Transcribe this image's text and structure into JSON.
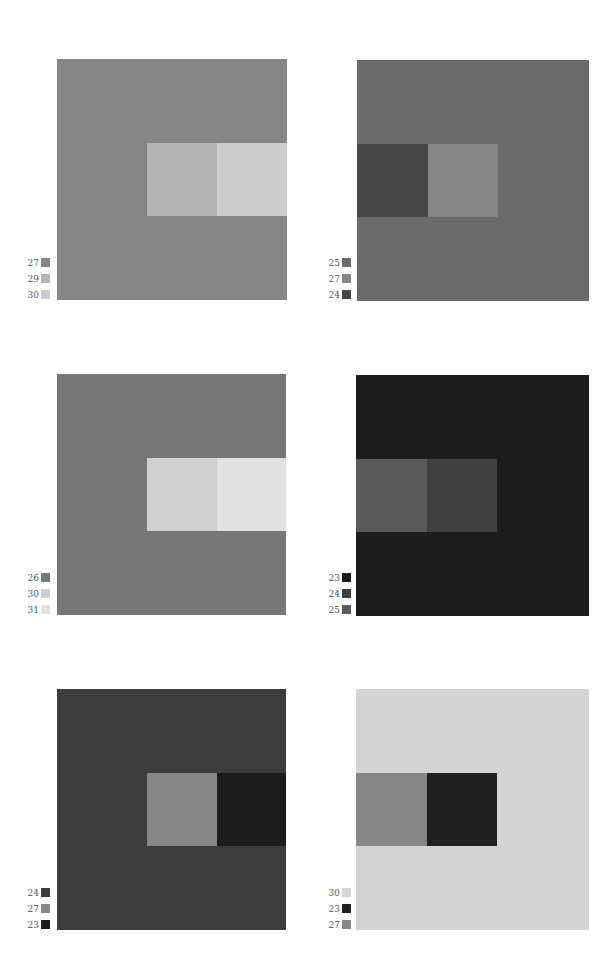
{
  "figure": {
    "panels": [
      {
        "id": 1,
        "background": {
          "value": "27",
          "color": "#858585"
        },
        "inner_left": {
          "value": "29",
          "color": "#b4b4b4"
        },
        "inner_right": {
          "value": "30",
          "color": "#cccccc"
        },
        "inner_position": "right",
        "legend": [
          {
            "label": "27",
            "color": "#858585"
          },
          {
            "label": "29",
            "color": "#b4b4b4"
          },
          {
            "label": "30",
            "color": "#cccccc"
          }
        ]
      },
      {
        "id": 2,
        "background": {
          "value": "25",
          "color": "#6a6a6a"
        },
        "inner_left": {
          "value": "24",
          "color": "#454545"
        },
        "inner_right": {
          "value": "27",
          "color": "#858585"
        },
        "inner_position": "left",
        "legend": [
          {
            "label": "25",
            "color": "#6a6a6a"
          },
          {
            "label": "27",
            "color": "#858585"
          },
          {
            "label": "24",
            "color": "#454545"
          }
        ]
      },
      {
        "id": 3,
        "background": {
          "value": "26",
          "color": "#777777"
        },
        "inner_left": {
          "value": "30",
          "color": "#d0d0d0"
        },
        "inner_right": {
          "value": "31",
          "color": "#e2e2e2"
        },
        "inner_position": "right",
        "legend": [
          {
            "label": "26",
            "color": "#777777"
          },
          {
            "label": "30",
            "color": "#d0d0d0"
          },
          {
            "label": "31",
            "color": "#e2e2e2"
          }
        ]
      },
      {
        "id": 4,
        "background": {
          "value": "23",
          "color": "#1c1c1c"
        },
        "inner_left": {
          "value": "25",
          "color": "#5a5a5a"
        },
        "inner_right": {
          "value": "24",
          "color": "#404040"
        },
        "inner_position": "left",
        "legend": [
          {
            "label": "23",
            "color": "#1c1c1c"
          },
          {
            "label": "24",
            "color": "#404040"
          },
          {
            "label": "25",
            "color": "#5a5a5a"
          }
        ]
      },
      {
        "id": 5,
        "background": {
          "value": "24",
          "color": "#3c3c3c"
        },
        "inner_left": {
          "value": "27",
          "color": "#878787"
        },
        "inner_right": {
          "value": "23",
          "color": "#1c1c1c"
        },
        "inner_position": "right",
        "legend": [
          {
            "label": "24",
            "color": "#3c3c3c"
          },
          {
            "label": "27",
            "color": "#878787"
          },
          {
            "label": "23",
            "color": "#1c1c1c"
          }
        ]
      },
      {
        "id": 6,
        "background": {
          "value": "30",
          "color": "#d4d4d4"
        },
        "inner_left": {
          "value": "27",
          "color": "#868686"
        },
        "inner_right": {
          "value": "23",
          "color": "#202020"
        },
        "inner_position": "left",
        "legend": [
          {
            "label": "30",
            "color": "#d4d4d4"
          },
          {
            "label": "23",
            "color": "#202020"
          },
          {
            "label": "27",
            "color": "#868686"
          }
        ]
      }
    ]
  },
  "layout": {
    "panel_positions": [
      {
        "square_left": 57,
        "square_top": 59,
        "legend_left": 10,
        "legend_top": 258
      },
      {
        "square_left": 357,
        "square_top": 60,
        "legend_left": 311,
        "legend_top": 258
      },
      {
        "square_left": 57,
        "square_top": 374,
        "legend_left": 10,
        "legend_top": 573
      },
      {
        "square_left": 356,
        "square_top": 375,
        "legend_left": 311,
        "legend_top": 573
      },
      {
        "square_left": 57,
        "square_top": 689,
        "legend_left": 10,
        "legend_top": 888
      },
      {
        "square_left": 356,
        "square_top": 689,
        "legend_left": 311,
        "legend_top": 888
      }
    ]
  }
}
